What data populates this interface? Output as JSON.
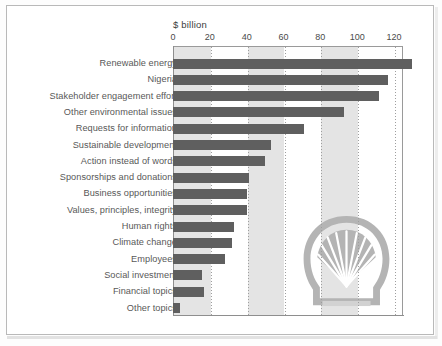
{
  "chart_data": {
    "type": "bar",
    "orientation": "horizontal",
    "title": "",
    "xlabel": "$ billion",
    "ylabel": "",
    "xlim": [
      0,
      125
    ],
    "xticks": [
      0,
      20,
      40,
      60,
      80,
      100,
      120
    ],
    "grid": true,
    "legend": false,
    "categories": [
      "Renewable energy",
      "Nigeria",
      "Stakeholder engagement effort",
      "Other environmental issues",
      "Requests for information",
      "Sustainable development",
      "Action instead of words",
      "Sponsorships and donations",
      "Business opportunities",
      "Values, principles, integrity",
      "Human rights",
      "Climate change",
      "Employees",
      "Social investment",
      "Financial topics",
      "Other topics"
    ],
    "values": [
      130,
      117,
      112,
      93,
      71,
      53,
      50,
      41,
      40,
      40,
      33,
      32,
      28,
      16,
      17,
      4
    ],
    "bar_color": "#5f5f5f",
    "band_color": "#e4e4e4",
    "watermark": "shell-pecten-logo"
  },
  "axis": {
    "title": "$ billion",
    "tick_labels": [
      "0",
      "20",
      "40",
      "60",
      "80",
      "100",
      "120"
    ]
  }
}
